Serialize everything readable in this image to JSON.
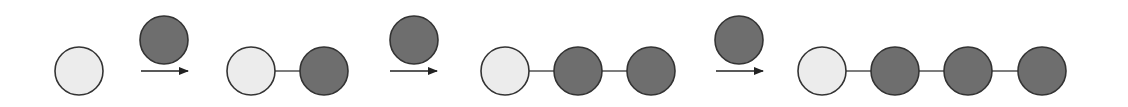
{
  "diagram": {
    "title": "",
    "colors": {
      "background": "#ffffff",
      "seed_fill": "#ececec",
      "added_fill": "#6e6e6e",
      "stroke": "#333333",
      "link": "#444444",
      "arrow": "#222222"
    },
    "node_radius": 24,
    "stages": [
      {
        "label": "",
        "nodes": [
          {
            "type": "seed",
            "cx": 79,
            "cy": 71
          }
        ]
      },
      {
        "label": "",
        "nodes": [
          {
            "type": "seed",
            "cx": 251,
            "cy": 71
          },
          {
            "type": "added",
            "cx": 324,
            "cy": 71
          }
        ]
      },
      {
        "label": "",
        "nodes": [
          {
            "type": "seed",
            "cx": 505,
            "cy": 71
          },
          {
            "type": "added",
            "cx": 578,
            "cy": 71
          },
          {
            "type": "added",
            "cx": 651,
            "cy": 71
          }
        ]
      },
      {
        "label": "",
        "nodes": [
          {
            "type": "seed",
            "cx": 822,
            "cy": 71
          },
          {
            "type": "added",
            "cx": 895,
            "cy": 71
          },
          {
            "type": "added",
            "cx": 968,
            "cy": 71
          },
          {
            "type": "added",
            "cx": 1042,
            "cy": 71
          }
        ]
      }
    ],
    "transitions": [
      {
        "x1": 141,
        "x2": 188,
        "y": 71,
        "incoming": {
          "type": "added",
          "cx": 164,
          "cy": 40
        }
      },
      {
        "x1": 390,
        "x2": 437,
        "y": 71,
        "incoming": {
          "type": "added",
          "cx": 414,
          "cy": 40
        }
      },
      {
        "x1": 716,
        "x2": 763,
        "y": 71,
        "incoming": {
          "type": "added",
          "cx": 739,
          "cy": 40
        }
      }
    ]
  }
}
